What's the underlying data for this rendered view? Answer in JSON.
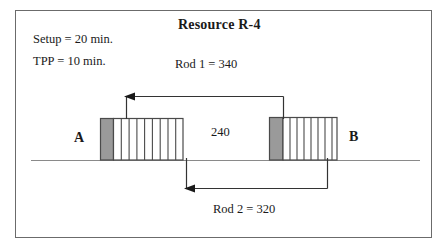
{
  "diagram": {
    "title": "Resource R-4",
    "notes": {
      "setup": "Setup = 20 min.",
      "tpp": "TPP = 10 min."
    },
    "labels": {
      "rod1": "Rod 1  =  340",
      "rod2": "Rod 2  =  320",
      "gap": "240",
      "point_a": "A",
      "point_b": "B"
    },
    "colors": {
      "setup_block_fill": "#9a9a9a",
      "setup_block_stroke": "#4a4a4a",
      "hatch_stroke": "#4a4a4a",
      "process_block_fill": "#ffffff",
      "timeline_stroke": "#808080",
      "arrow_stroke": "#333333",
      "frame_stroke": "#6b6b6b",
      "text": "#1a1a1a"
    },
    "timeline": {
      "y": 160,
      "x_start": 31,
      "x_end": 420
    },
    "blocks": [
      {
        "name": "block-a",
        "setup": {
          "x": 100,
          "width": 13,
          "top": 118,
          "height": 42
        },
        "process": {
          "x": 113,
          "width": 70,
          "top": 118,
          "height": 42,
          "divisions": 9
        }
      },
      {
        "name": "block-b",
        "setup": {
          "x": 269,
          "width": 14,
          "top": 117,
          "height": 43
        },
        "process": {
          "x": 283,
          "width": 54,
          "top": 117,
          "height": 43,
          "divisions": 7
        }
      }
    ],
    "arrows": [
      {
        "name": "rod1-arrow",
        "from_x": 283,
        "from_y": 118,
        "rise_y": 96,
        "to_x": 126,
        "head": "left"
      },
      {
        "name": "rod2-arrow",
        "from_x": 327,
        "from_y": 160,
        "drop_y": 188,
        "to_x": 186,
        "head": "left"
      }
    ]
  }
}
